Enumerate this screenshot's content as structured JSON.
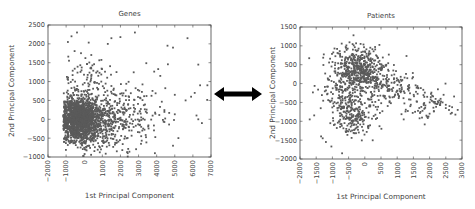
{
  "figure": {
    "arrow_icon": "double-headed-arrow"
  },
  "chart_data": [
    {
      "type": "scatter",
      "title": "Genes",
      "xlabel": "1st Principal Component",
      "ylabel": "2nd Principal Component",
      "xlim": [
        -2000,
        7000
      ],
      "ylim": [
        -1000,
        2500
      ],
      "xticks": [
        -2000,
        -1000,
        0,
        1000,
        2000,
        3000,
        4000,
        5000,
        6000,
        7000
      ],
      "xtick_labels": [
        "−2000",
        "−1000",
        "0",
        "1000",
        "2000",
        "3000",
        "4000",
        "5000",
        "6000",
        "7000"
      ],
      "yticks": [
        -1000,
        -500,
        0,
        500,
        1000,
        1500,
        2000,
        2500
      ],
      "ytick_labels": [
        "−1000",
        "−500",
        "0",
        "500",
        "1000",
        "1500",
        "2000",
        "2500"
      ],
      "grid": false,
      "marker_color": "#5a5a5a",
      "clusters": [
        {
          "cx": -300,
          "cy": 0,
          "sx": 500,
          "sy": 280,
          "n": 1400,
          "xmin": -1150
        },
        {
          "cx": 700,
          "cy": -100,
          "sx": 900,
          "sy": 350,
          "n": 500,
          "xmin": -1100
        },
        {
          "cx": 2200,
          "cy": 150,
          "sx": 1200,
          "sy": 450,
          "n": 220,
          "xmin": -1000
        },
        {
          "cx": 200,
          "cy": 900,
          "sx": 700,
          "sy": 500,
          "n": 110,
          "xmin": -1000
        }
      ],
      "outliers": [
        {
          "x": -400,
          "y": 2300
        },
        {
          "x": -700,
          "y": 2200
        },
        {
          "x": -900,
          "y": 2050
        },
        {
          "x": 1500,
          "y": 2150
        },
        {
          "x": 2800,
          "y": 2300
        },
        {
          "x": 1300,
          "y": 2000
        },
        {
          "x": 2000,
          "y": 2180
        },
        {
          "x": 4600,
          "y": 1950
        },
        {
          "x": 4900,
          "y": 1900
        },
        {
          "x": 5700,
          "y": 2150
        },
        {
          "x": 6300,
          "y": 1450
        },
        {
          "x": 4200,
          "y": 1150
        },
        {
          "x": 6400,
          "y": 900
        },
        {
          "x": 6800,
          "y": 900
        },
        {
          "x": 6100,
          "y": 700
        },
        {
          "x": 5900,
          "y": 600
        },
        {
          "x": 5000,
          "y": 650
        },
        {
          "x": 5600,
          "y": 500
        },
        {
          "x": 6300,
          "y": 0
        },
        {
          "x": 6500,
          "y": -100
        },
        {
          "x": 6200,
          "y": 100
        },
        {
          "x": 5200,
          "y": -500
        },
        {
          "x": 4900,
          "y": -700
        },
        {
          "x": 3900,
          "y": -900
        },
        {
          "x": 2400,
          "y": -900
        },
        {
          "x": 1800,
          "y": -850
        }
      ]
    },
    {
      "type": "scatter",
      "title": "Patients",
      "xlabel": "1st Principal Component",
      "ylabel": "2nd Principal Component",
      "xlim": [
        -2000,
        3000
      ],
      "ylim": [
        -2000,
        1500
      ],
      "xticks": [
        -2000,
        -1500,
        -1000,
        -500,
        0,
        500,
        1000,
        1500,
        2000,
        2500,
        3000
      ],
      "xtick_labels": [
        "−2000",
        "−1500",
        "−1000",
        "−500",
        "0",
        "500",
        "1000",
        "1500",
        "2000",
        "2500",
        "3000"
      ],
      "yticks": [
        -2000,
        -1500,
        -1000,
        -500,
        0,
        500,
        1000,
        1500
      ],
      "ytick_labels": [
        "−2000",
        "−1500",
        "−1000",
        "−500",
        "0",
        "500",
        "1000",
        "1500"
      ],
      "grid": false,
      "marker_color": "#5a5a5a",
      "clusters": [
        {
          "cx": -150,
          "cy": 350,
          "sx": 380,
          "sy": 300,
          "n": 520
        },
        {
          "cx": -350,
          "cy": -750,
          "sx": 300,
          "sy": 330,
          "n": 260
        },
        {
          "cx": 800,
          "cy": -150,
          "sx": 450,
          "sy": 250,
          "n": 150
        },
        {
          "cx": 1900,
          "cy": -500,
          "sx": 400,
          "sy": 200,
          "n": 70
        },
        {
          "cx": -900,
          "cy": -200,
          "sx": 300,
          "sy": 350,
          "n": 70
        }
      ],
      "outliers": [
        {
          "x": -350,
          "y": 1280
        },
        {
          "x": -1700,
          "y": -950
        },
        {
          "x": -700,
          "y": -1850
        },
        {
          "x": -1350,
          "y": -1400
        },
        {
          "x": -1300,
          "y": -1450
        },
        {
          "x": -1200,
          "y": -1550
        },
        {
          "x": 1200,
          "y": -950
        },
        {
          "x": 2000,
          "y": -800
        },
        {
          "x": 1900,
          "y": -850
        },
        {
          "x": 2600,
          "y": -700
        },
        {
          "x": 2650,
          "y": -800
        },
        {
          "x": 2500,
          "y": -650
        },
        {
          "x": 2400,
          "y": -500
        },
        {
          "x": 2300,
          "y": -450
        }
      ]
    }
  ]
}
